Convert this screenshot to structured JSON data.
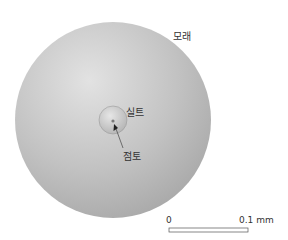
{
  "diagram": {
    "labels": {
      "sand": "모래",
      "silt": "실트",
      "clay": "점토"
    },
    "scale_bar": {
      "start": "0",
      "end": "0.1 mm"
    },
    "colors": {
      "sand_fill": "#bdbdbd",
      "silt_fill": "#c8c8c8",
      "clay_fill": "#8a8a8a",
      "text": "#333333"
    }
  }
}
